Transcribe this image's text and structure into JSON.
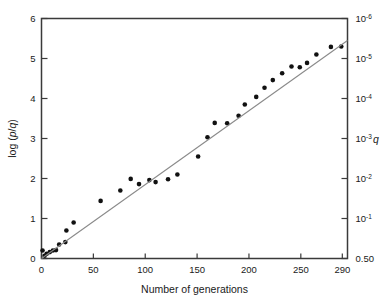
{
  "figure": {
    "background": "#ffffff",
    "frame_color": "#3a3a3a",
    "point_color": "#111111",
    "line_color": "#8a8a8a"
  },
  "axes": {
    "x": {
      "title": "Number of generations",
      "ticks": [
        "0",
        "50",
        "100",
        "150",
        "200",
        "250",
        "290"
      ],
      "tick_values": [
        0,
        50,
        100,
        150,
        200,
        250,
        290
      ],
      "range": [
        0,
        295
      ]
    },
    "y_left": {
      "title": "log (p/q)",
      "title_parts": {
        "pre": "log (",
        "italic_p": "p",
        "slash": "/",
        "italic_q": "q",
        "post": ")"
      },
      "ticks": [
        "0",
        "1",
        "2",
        "3",
        "4",
        "5",
        "6"
      ],
      "tick_values": [
        0,
        1,
        2,
        3,
        4,
        5,
        6
      ],
      "range": [
        0,
        6
      ]
    },
    "y_right": {
      "title": "q",
      "ticks": [
        "0.50",
        "10-1",
        "10-2",
        "10-3",
        "10-4",
        "10-5",
        "10-6"
      ],
      "tick_mantissas": [
        "0.50",
        "10",
        "10",
        "10",
        "10",
        "10",
        "10"
      ],
      "tick_exponents": [
        "",
        "-1",
        "-2",
        "-3",
        "-4",
        "-5",
        "-6"
      ],
      "tick_at_left_value": [
        0,
        1,
        2,
        3,
        4,
        5,
        6
      ]
    }
  },
  "chart_data": {
    "type": "scatter",
    "title": "",
    "subtitle": "",
    "xlabel": "Number of generations",
    "ylabel": "log (p/q)",
    "ylabel_right": "q",
    "xlim": [
      0,
      295
    ],
    "ylim": [
      0,
      6
    ],
    "grid": false,
    "legend": null,
    "series": [
      {
        "name": "observations",
        "marker": "filled-circle",
        "color": "#111111",
        "points": [
          [
            1,
            0.2
          ],
          [
            3,
            0.07
          ],
          [
            5,
            0.12
          ],
          [
            8,
            0.16
          ],
          [
            11,
            0.2
          ],
          [
            14,
            0.21
          ],
          [
            17,
            0.35
          ],
          [
            23,
            0.41
          ],
          [
            24,
            0.7
          ],
          [
            31,
            0.9
          ],
          [
            57,
            1.44
          ],
          [
            76,
            1.7
          ],
          [
            86,
            1.99
          ],
          [
            94,
            1.86
          ],
          [
            104,
            1.96
          ],
          [
            110,
            1.91
          ],
          [
            122,
            1.98
          ],
          [
            131,
            2.1
          ],
          [
            151,
            2.55
          ],
          [
            160,
            3.03
          ],
          [
            167,
            3.39
          ],
          [
            179,
            3.38
          ],
          [
            190,
            3.57
          ],
          [
            196,
            3.85
          ],
          [
            207,
            4.04
          ],
          [
            215,
            4.27
          ],
          [
            223,
            4.46
          ],
          [
            232,
            4.63
          ],
          [
            241,
            4.8
          ],
          [
            249,
            4.78
          ],
          [
            256,
            4.89
          ],
          [
            265,
            5.1
          ],
          [
            279,
            5.29
          ],
          [
            289,
            5.3
          ]
        ]
      },
      {
        "name": "fitted-line",
        "marker": "none",
        "color": "#8a8a8a",
        "line_endpoints": [
          [
            0,
            0.0
          ],
          [
            295,
            5.45
          ]
        ]
      }
    ]
  }
}
